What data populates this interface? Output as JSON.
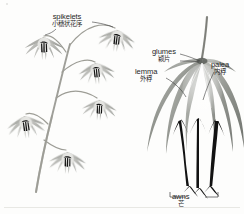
{
  "figure": {
    "background_color": "#fdfdfc",
    "ink_color": "#2a2a2a",
    "panels": [
      {
        "name": "inflorescence-panel",
        "description": "Nodding branched inflorescence with six drooping spikelets"
      },
      {
        "name": "spikelet-detail-panel",
        "description": "Enlarged single spikelet showing glumes, lemma, palea and awns"
      }
    ]
  },
  "labels": {
    "spikelets": {
      "en": "spikelets",
      "zh": "小穗状花序"
    },
    "glumes": {
      "en": "glumes",
      "zh": "颖片"
    },
    "lemma": {
      "en": "lemma",
      "zh": "外稃"
    },
    "palea": {
      "en": "palea",
      "zh": "内稃"
    },
    "awns": {
      "en": "awns",
      "zh": "芒"
    }
  },
  "colors": {
    "stem": "#9a9a93",
    "bract_light": "#c9c9c4",
    "bract_mid": "#8e8f8a",
    "bract_dark": "#6f726e",
    "awn_dark": "#1a1a1a",
    "leader_line": "#3a3a3a",
    "frame_line": "#d8d8d4"
  }
}
